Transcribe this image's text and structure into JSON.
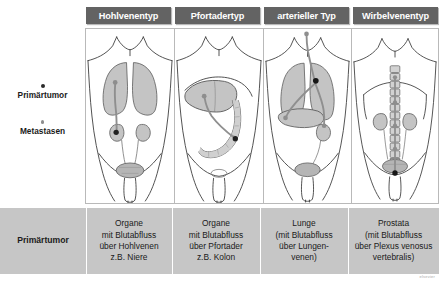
{
  "figure": {
    "watermark": "elsevier"
  },
  "columns": [
    {
      "id": "hohlvenentyp",
      "header": "Hohlvenentyp"
    },
    {
      "id": "pfortadertyp",
      "header": "Pfortadertyp"
    },
    {
      "id": "arterieller_typ",
      "header": "arterieller Typ"
    },
    {
      "id": "wirbelvenentyp",
      "header": "Wirbelvenentyp"
    }
  ],
  "legend": {
    "items": [
      {
        "id": "primaertumor",
        "label": "Primärtumor",
        "marker": "dot-dark",
        "color": "#2b2b2b"
      },
      {
        "id": "metastasen",
        "label": "Metastasen",
        "marker": "dot-light",
        "color": "#8e8e8e"
      }
    ]
  },
  "table": {
    "row_header": "Primärtumor",
    "cells": [
      "Organe\nmit Blutabfluss\nüber Hohlvenen\nz.B. Niere",
      "Organe\nmit Blutabfluss\nüber Pfortader\nz.B. Kolon",
      "Lunge\n(mit Blutabfluss\nüber Lungen-\nvenen)",
      "Prostata\n(mit Blutabfluss\nüber Plexus venosus\nvertebralis)"
    ]
  },
  "diagrams": [
    {
      "id": "hohlvenentyp",
      "organs": [
        "lungs",
        "kidneys",
        "ureters",
        "bladder",
        "penis"
      ],
      "primary_tumor_site": "right kidney",
      "metastasis_sites": [
        "right lung"
      ],
      "route": "vena cava"
    },
    {
      "id": "pfortadertyp",
      "organs": [
        "liver",
        "colon",
        "bladder",
        "penis"
      ],
      "primary_tumor_site": "colon",
      "metastasis_sites": [
        "liver"
      ],
      "route": "portal vein"
    },
    {
      "id": "arterieller_typ",
      "organs": [
        "lungs",
        "liver",
        "kidney",
        "bladder",
        "penis",
        "brain"
      ],
      "primary_tumor_site": "left lung",
      "metastasis_sites": [
        "brain",
        "liver",
        "kidney"
      ],
      "route": "arterial"
    },
    {
      "id": "wirbelvenentyp",
      "organs": [
        "vertebral column",
        "kidneys",
        "bladder",
        "prostate",
        "penis"
      ],
      "primary_tumor_site": "prostate",
      "metastasis_sites": [
        "vertebral column"
      ],
      "route": "plexus venosus vertebralis"
    }
  ],
  "colors": {
    "badge_bg": "#636363",
    "badge_text": "#ffffff",
    "table_bg": "#c6c6c6",
    "organ_fill": "#c4c4c4",
    "body_outline": "#3d3d3d",
    "vessel": "#8a8a8a",
    "tumor": "#2b2b2b",
    "metastasis": "#8e8e8e"
  }
}
